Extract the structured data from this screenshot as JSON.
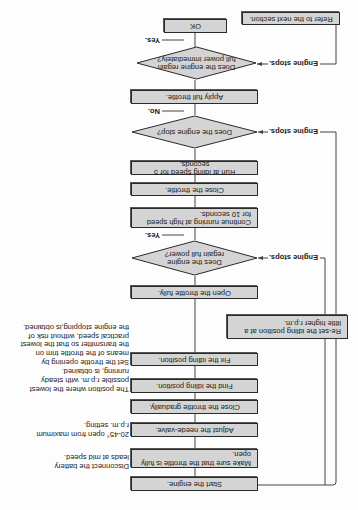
{
  "flowchart": {
    "steps": {
      "start": "Start the engine.",
      "make_sure": "Make sure that the throttle is fully open.",
      "adjust_needle": "Adjust the neede-valve.",
      "close_gradually": "Close the throttle gradually.",
      "find_idling": "Find the idling position.",
      "fix_idling": "Fix the idling position.",
      "open_fully": "Open the throttle fully.",
      "continue_high": "Continue running at high speed for 10 seconds.",
      "close_throttle": "Close the throttle.",
      "run_idle": "Run at idling speed for 5 seconds.",
      "apply_full": "Apply full throttle.",
      "ok": "OK",
      "reset_idling": "Re-set the idling position at a little higher r.p.m.",
      "refer_next": "Refer to the next section."
    },
    "decisions": {
      "regain_power": "Does the engine regain full power?",
      "engine_stop": "Does the engine stop?",
      "regain_immediately": "Does the engine regain full power immediately?"
    },
    "branch_labels": {
      "yes_1": "Yes.",
      "engine_stops_1": "Engine stops.",
      "no_2": "No.",
      "engine_stops_2": "Engine stops.",
      "yes_3": "Yes.",
      "engine_stops_3": "Engine stops."
    },
    "notes": {
      "battery": "Disconnect the battery\nleads at mid speed.",
      "needle": "20-45° open from maximum\nr.p.m. setting.",
      "idling": "The position where the lowest\npossible r.p.m. with steady\nrunning, is obtained.",
      "trim": "Set the throttle opening by\nmeans of the throttle trim on\nthe transmitter so that the lowest\npractical speed, without risk of\nthe engine stopping,is obtained."
    }
  },
  "colors": {
    "box_fill": "#d4d4d4",
    "border": "#2a2a2a",
    "background": "#fdfdfd"
  },
  "orientation": "rotated-180"
}
